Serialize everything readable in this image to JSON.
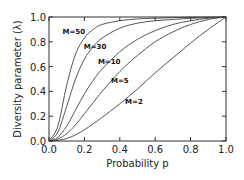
{
  "chart_data": {
    "type": "line",
    "title": "",
    "xlabel": "Probability p",
    "ylabel": "Diversity parameter (λ)",
    "xlim": [
      0.0,
      1.0
    ],
    "ylim": [
      0.0,
      1.0
    ],
    "xticks": [
      "0.0",
      "0.2",
      "0.4",
      "0.6",
      "0.8",
      "1.0"
    ],
    "yticks": [
      "0.0",
      "0.2",
      "0.4",
      "0.6",
      "0.8",
      "1.0"
    ],
    "grid": false,
    "legend": "inline labels",
    "x": [
      0.0,
      0.05,
      0.1,
      0.15,
      0.2,
      0.25,
      0.3,
      0.4,
      0.5,
      0.6,
      0.7,
      0.8,
      0.9,
      1.0
    ],
    "series": [
      {
        "name": "M=50",
        "label_pos": [
          0.14,
          0.86
        ],
        "values": [
          0.0,
          0.12,
          0.45,
          0.7,
          0.83,
          0.9,
          0.94,
          0.97,
          0.985,
          0.99,
          0.995,
          0.998,
          0.999,
          1.0
        ]
      },
      {
        "name": "M=30",
        "label_pos": [
          0.26,
          0.74
        ],
        "values": [
          0.0,
          0.07,
          0.28,
          0.5,
          0.66,
          0.76,
          0.83,
          0.91,
          0.95,
          0.97,
          0.98,
          0.99,
          0.995,
          1.0
        ]
      },
      {
        "name": "M=10",
        "label_pos": [
          0.34,
          0.62
        ],
        "values": [
          0.0,
          0.03,
          0.12,
          0.25,
          0.38,
          0.49,
          0.58,
          0.72,
          0.82,
          0.89,
          0.94,
          0.97,
          0.99,
          1.0
        ]
      },
      {
        "name": "M=5",
        "label_pos": [
          0.4,
          0.47
        ],
        "values": [
          0.0,
          0.015,
          0.06,
          0.13,
          0.22,
          0.31,
          0.4,
          0.56,
          0.69,
          0.8,
          0.88,
          0.94,
          0.98,
          1.0
        ]
      },
      {
        "name": "M=2",
        "label_pos": [
          0.48,
          0.3
        ],
        "values": [
          0.0,
          0.005,
          0.02,
          0.05,
          0.09,
          0.14,
          0.19,
          0.3,
          0.42,
          0.55,
          0.67,
          0.79,
          0.9,
          1.0
        ]
      }
    ]
  }
}
